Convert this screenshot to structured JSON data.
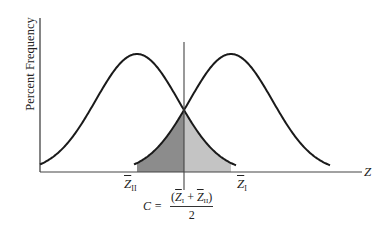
{
  "diagram": {
    "y_axis_label": "Percent Frequency",
    "x_axis_label": "Z",
    "distributions": [
      {
        "name": "group-II",
        "mean_label_symbol": "Z",
        "mean_label_subscript": "II",
        "mean_px": 137
      },
      {
        "name": "group-I",
        "mean_label_symbol": "Z",
        "mean_label_subscript": "I",
        "mean_px": 231
      }
    ],
    "cutoff": {
      "label_lhs": "C =",
      "numerator_open": "(",
      "numerator_symbol_1": "Z",
      "numerator_sub_1": "I",
      "numerator_plus": " + ",
      "numerator_symbol_2": "Z",
      "numerator_sub_2": "II",
      "numerator_close": ")",
      "denominator": "2"
    },
    "colors": {
      "curve": "#1a1a1a",
      "axis": "#333333",
      "shade_left": "#8c8c8c",
      "shade_right": "#c4c4c4"
    }
  }
}
